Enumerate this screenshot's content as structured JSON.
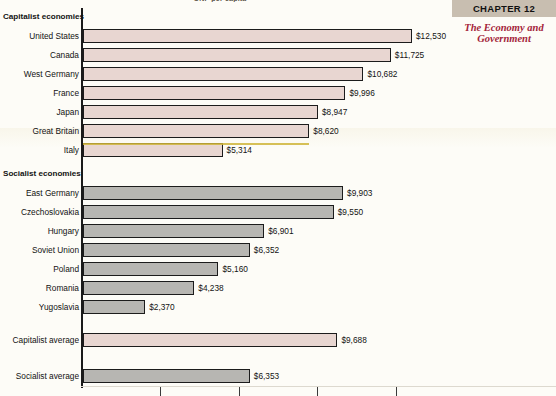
{
  "page": {
    "top_caption": "GNP per capita",
    "chapter_label": "CHAPTER 12",
    "chapter_title": "The Economy and Government"
  },
  "colors": {
    "capitalist_bar": "#e8d6d1",
    "socialist_bar": "#b7b6b2",
    "bar_outline": "#1c1c1c",
    "chapter_box": "#c8beb0",
    "chapter_title": "#a4243a",
    "highlight": "#cfb53b",
    "page_background": "#fdfcf7"
  },
  "chart_data": {
    "type": "bar",
    "orientation": "horizontal",
    "title": "GNP per capita",
    "xlabel": "",
    "ylabel": "",
    "xlim": [
      0,
      12600
    ],
    "grid": false,
    "legend": "none",
    "value_prefix": "$",
    "axis_ticks": [
      3000,
      6000,
      9000,
      12000
    ],
    "groups": [
      {
        "name": "Capitalist economies",
        "style": "capitalist",
        "categories": [
          "United States",
          "Canada",
          "West Germany",
          "France",
          "Japan",
          "Great Britain",
          "Italy"
        ],
        "values": [
          12530,
          11725,
          10682,
          9996,
          8947,
          8620,
          5314
        ],
        "labels": [
          "$12,530",
          "$11,725",
          "$10,682",
          "$9,996",
          "$8,947",
          "$8,620",
          "$5,314"
        ]
      },
      {
        "name": "Socialist economies",
        "style": "socialist",
        "categories": [
          "East Germany",
          "Czechoslovakia",
          "Hungary",
          "Soviet Union",
          "Poland",
          "Romania",
          "Yugoslavia"
        ],
        "values": [
          9903,
          9550,
          6901,
          6352,
          5160,
          4238,
          2370
        ],
        "labels": [
          "$9,903",
          "$9,550",
          "$6,901",
          "$6,352",
          "$5,160",
          "$4,238",
          "$2,370"
        ]
      },
      {
        "name": "Averages",
        "style": "mixed",
        "categories": [
          "Capitalist average",
          "Socialist average"
        ],
        "values": [
          9688,
          6353
        ],
        "labels": [
          "$9,688",
          "$6,353"
        ],
        "styles": [
          "capitalist",
          "socialist"
        ]
      }
    ]
  }
}
